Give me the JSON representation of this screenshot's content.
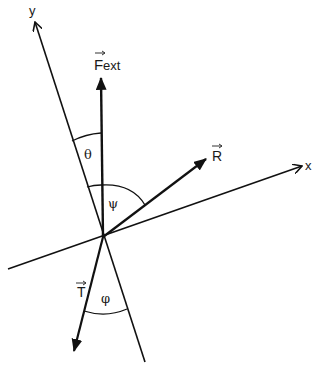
{
  "diagram": {
    "background": "#ffffff",
    "line_color": "#111111",
    "origin": [
      103,
      237
    ],
    "axes": {
      "x": {
        "label": "x",
        "start": [
          8,
          269
        ],
        "end": [
          302,
          166
        ]
      },
      "y": {
        "label": "y",
        "start": [
          145,
          362
        ],
        "end": [
          35,
          22
        ]
      }
    },
    "vectors": {
      "F_ext": {
        "label_main": "F",
        "label_sub": "ext",
        "end": [
          101,
          77
        ]
      },
      "R": {
        "label": "R",
        "end": [
          207,
          158
        ]
      },
      "T": {
        "label": "T",
        "end": [
          73,
          352
        ]
      }
    },
    "angles": {
      "theta": {
        "label": "θ",
        "between": [
          "F_ext",
          "y"
        ]
      },
      "psi": {
        "label": "ψ",
        "between": [
          "F_ext",
          "R"
        ]
      },
      "phi": {
        "label": "φ",
        "between": [
          "T",
          "-y"
        ]
      }
    }
  }
}
